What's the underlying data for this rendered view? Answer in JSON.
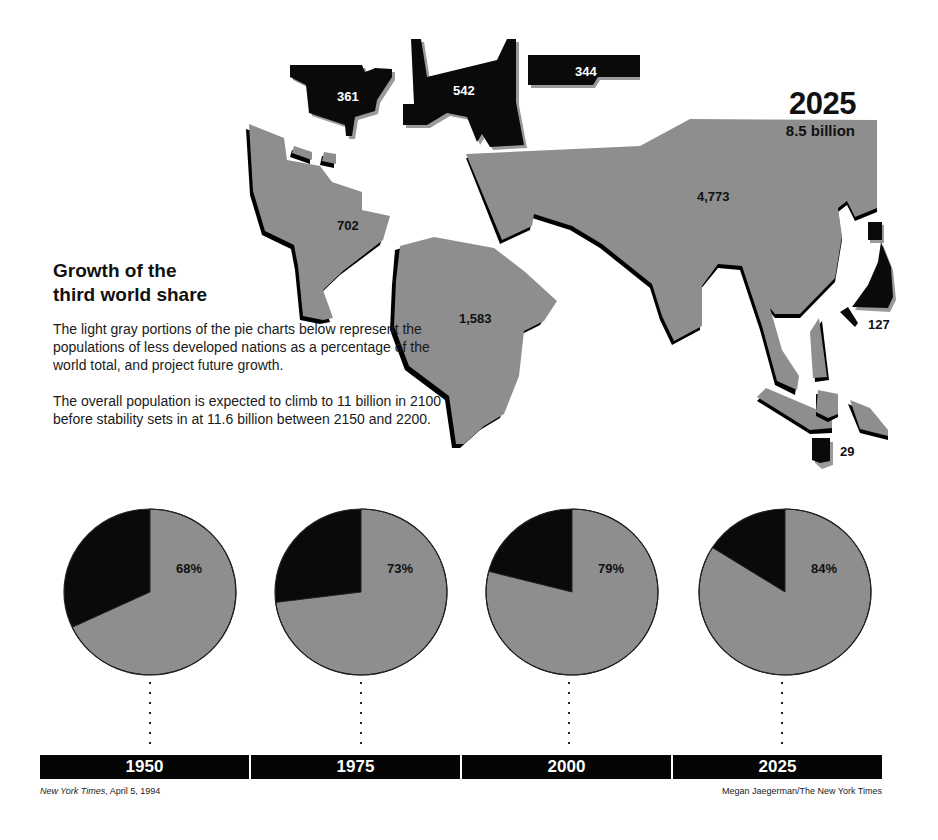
{
  "header": {
    "year": "2025",
    "population": "8.5 billion"
  },
  "intro": {
    "title_line1": "Growth of the",
    "title_line2": "third world share",
    "paragraph1": "The light gray portions of the pie charts below represent the populations of less developed nations as a percentage of the world total, and project future growth.",
    "paragraph2": "The overall population is expected to climb to 11 billion in 2100 before stability sets in at 11.6 billion between 2150 and 2200."
  },
  "map": {
    "units_note": "Population in millions, 2025",
    "regions": [
      {
        "name": "North America",
        "value": "361",
        "shade": "developed"
      },
      {
        "name": "Europe",
        "value": "542",
        "shade": "developed"
      },
      {
        "name": "Former Soviet Union",
        "value": "344",
        "shade": "developed"
      },
      {
        "name": "Latin America",
        "value": "702",
        "shade": "developing"
      },
      {
        "name": "Africa",
        "value": "1,583",
        "shade": "developing"
      },
      {
        "name": "Asia",
        "value": "4,773",
        "shade": "developing"
      },
      {
        "name": "Japan",
        "value": "127",
        "shade": "developed"
      },
      {
        "name": "Australia/New Zealand",
        "value": "29",
        "shade": "developed"
      }
    ]
  },
  "timeline": {
    "years": [
      "1950",
      "1975",
      "2000",
      "2025"
    ]
  },
  "pies": [
    {
      "year": "1950",
      "label": "68%",
      "developing": 68
    },
    {
      "year": "1975",
      "label": "73%",
      "developing": 73
    },
    {
      "year": "2000",
      "label": "79%",
      "developing": 79
    },
    {
      "year": "2025",
      "label": "84%",
      "developing": 84
    }
  ],
  "footer": {
    "source_italic": "New York Times",
    "source_rest": ", April 5, 1994",
    "credit": "Megan Jaegerman/The New York Times"
  },
  "colors": {
    "developing": "#8e8e8e",
    "developed": "#0a0a0a",
    "background": "#ffffff"
  },
  "chart_data": [
    {
      "type": "pie",
      "title": "1950",
      "categories": [
        "Less developed nations",
        "Developed nations"
      ],
      "values": [
        68,
        32
      ]
    },
    {
      "type": "pie",
      "title": "1975",
      "categories": [
        "Less developed nations",
        "Developed nations"
      ],
      "values": [
        73,
        27
      ]
    },
    {
      "type": "pie",
      "title": "2000",
      "categories": [
        "Less developed nations",
        "Developed nations"
      ],
      "values": [
        79,
        21
      ]
    },
    {
      "type": "pie",
      "title": "2025",
      "categories": [
        "Less developed nations",
        "Developed nations"
      ],
      "values": [
        84,
        16
      ]
    },
    {
      "type": "table",
      "title": "2025 population by region (millions), total 8.5 billion",
      "categories": [
        "North America",
        "Europe",
        "Former Soviet Union",
        "Latin America",
        "Africa",
        "Asia",
        "Japan",
        "Australia/New Zealand"
      ],
      "values": [
        361,
        542,
        344,
        702,
        1583,
        4773,
        127,
        29
      ]
    }
  ]
}
